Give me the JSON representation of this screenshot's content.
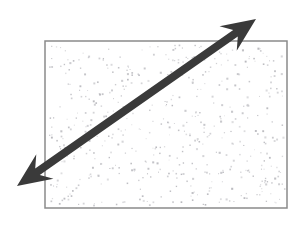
{
  "figure": {
    "canvas": {
      "width": 302,
      "height": 225,
      "background": "#ffffff"
    },
    "title": "",
    "caption": "",
    "region": {
      "name": "stippled-rectangle",
      "label": "",
      "x": 45,
      "y": 41,
      "width": 242,
      "height": 167,
      "border_color": "#8a8a8a",
      "border_width": 1.5,
      "fill_color": "#ffffff",
      "texture": {
        "type": "stipple-dots",
        "dot_color": "#b9b9be",
        "dot_size": 1.4,
        "approx_count": 520,
        "description": "random light gray speckle fill"
      }
    },
    "arrow": {
      "name": "double-headed-diagonal-arrow",
      "label": "",
      "color": "#3a3a3a",
      "shaft_width": 8,
      "start": {
        "x": 17,
        "y": 186
      },
      "end": {
        "x": 256,
        "y": 19
      },
      "heads": [
        "start",
        "end"
      ],
      "head_length": 34,
      "head_half_width": 15,
      "head_notch": 9,
      "direction": "lower-left to upper-right",
      "angle_degrees": 35
    }
  }
}
